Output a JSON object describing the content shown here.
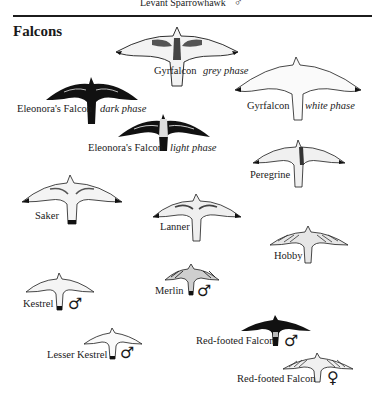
{
  "page": {
    "top_caption": "Levant Sparrowhawk",
    "top_caption_symbol": "♂",
    "section_title": "Falcons"
  },
  "birds": [
    {
      "name": "Gyrfalcon",
      "phase": "grey phase",
      "sex": "",
      "style": "pale-marked"
    },
    {
      "name": "Gyrfalcon",
      "phase": "white phase",
      "sex": "",
      "style": "white"
    },
    {
      "name": "Eleonora's Falcon",
      "phase": "dark phase",
      "sex": "",
      "style": "dark"
    },
    {
      "name": "Eleonora's Falcon",
      "phase": "light phase",
      "sex": "",
      "style": "dark-pale-body"
    },
    {
      "name": "Peregrine",
      "phase": "",
      "sex": "",
      "style": "barred"
    },
    {
      "name": "Saker",
      "phase": "",
      "sex": "",
      "style": "pale-marked"
    },
    {
      "name": "Lanner",
      "phase": "",
      "sex": "",
      "style": "barred"
    },
    {
      "name": "Hobby",
      "phase": "",
      "sex": "",
      "style": "streaked"
    },
    {
      "name": "Kestrel",
      "phase": "",
      "sex": "♂",
      "style": "pale"
    },
    {
      "name": "Merlin",
      "phase": "",
      "sex": "♂",
      "style": "streaked"
    },
    {
      "name": "Lesser Kestrel",
      "phase": "",
      "sex": "♂",
      "style": "white"
    },
    {
      "name": "Red-footed Falcon",
      "phase": "",
      "sex": "♂",
      "style": "dark"
    },
    {
      "name": "Red-footed Falcon",
      "phase": "",
      "sex": "♀",
      "style": "barred"
    }
  ],
  "colors": {
    "ink": "#1a1a1a",
    "background": "#ffffff",
    "dark_plumage": "#111111",
    "light_plumage": "#f4f4f4"
  }
}
